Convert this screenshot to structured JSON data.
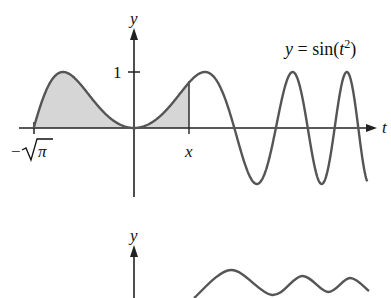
{
  "chart_data": [
    {
      "type": "line",
      "title": "",
      "function_label": "y = sin(t²)",
      "function_label_parts": {
        "lhs": "y",
        "eq": " = ",
        "fn": "sin(",
        "var": "t",
        "exp": "2",
        "close": ")"
      },
      "xlabel": "t",
      "ylabel": "y",
      "x_tick_labels": [
        "−√π",
        "x"
      ],
      "x_tick_values": [
        -1.7725,
        0.97
      ],
      "y_tick_labels": [
        "1"
      ],
      "y_tick_values": [
        1
      ],
      "xlim": [
        -2.0,
        4.3
      ],
      "ylim": [
        -1.2,
        1.6
      ],
      "grid": false,
      "shaded_region": {
        "from": "−√π",
        "to": "x",
        "from_value": -1.7725,
        "to_value": 0.97,
        "color": "#d9d9d9"
      },
      "series": [
        {
          "name": "sin(t^2)",
          "x_range": [
            -1.7725,
            4.12
          ],
          "peaks_t": [
            -1.2533,
            1.2533,
            2.8025,
            3.7599
          ],
          "troughs_t": [
            2.1708,
            3.3322,
            4.1
          ]
        }
      ]
    },
    {
      "type": "line",
      "title": "",
      "ylabel": "y",
      "partial": true,
      "series": [
        {
          "name": "integral curve (partial view)",
          "points_px": [
            [
              194,
              298
            ],
            [
              231,
              270
            ],
            [
              272,
              295
            ],
            [
              302,
              276
            ],
            [
              328,
              292
            ],
            [
              350,
              278
            ],
            [
              369,
              291
            ]
          ]
        }
      ]
    }
  ],
  "labels": {
    "y_axis_top": "y",
    "y_axis_bottom": "y",
    "t_axis": "t",
    "one": "1",
    "neg_sqrt_pi_minus": "−",
    "neg_sqrt_pi_pi": "π",
    "x_marker": "x",
    "eq_lhs": "y",
    "eq_mid": " = sin(",
    "eq_var": "t",
    "eq_exp": "2",
    "eq_close": ")"
  },
  "colors": {
    "curve": "#555555",
    "axis": "#222222",
    "shade": "#d6d6d6"
  }
}
